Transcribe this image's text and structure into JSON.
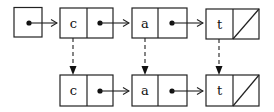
{
  "diagram": {
    "colors": {
      "stroke": "#222222",
      "background": "#ffffff"
    },
    "head": {
      "label": ""
    },
    "top_row": [
      {
        "value": "c"
      },
      {
        "value": "a"
      },
      {
        "value": "t"
      }
    ],
    "bottom_row": [
      {
        "value": "c"
      },
      {
        "value": "a"
      },
      {
        "value": "t"
      }
    ],
    "last_pointer": "null-slash"
  }
}
